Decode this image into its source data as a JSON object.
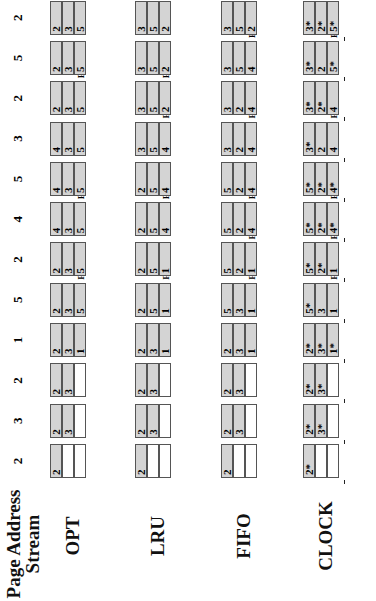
{
  "title": "Page Address Stream",
  "stream": [
    "2",
    "3",
    "2",
    "1",
    "5",
    "2",
    "4",
    "5",
    "3",
    "2",
    "5",
    "2"
  ],
  "rows": [
    {
      "label": "OPT",
      "steps": [
        {
          "frames": [
            "2",
            "",
            ""
          ],
          "fault": ""
        },
        {
          "frames": [
            "2",
            "3",
            ""
          ],
          "fault": ""
        },
        {
          "frames": [
            "2",
            "3",
            ""
          ],
          "fault": ""
        },
        {
          "frames": [
            "2",
            "3",
            "1"
          ],
          "fault": ""
        },
        {
          "frames": [
            "2",
            "3",
            "5"
          ],
          "fault": "F"
        },
        {
          "frames": [
            "2",
            "3",
            "5"
          ],
          "fault": ""
        },
        {
          "frames": [
            "4",
            "3",
            "5"
          ],
          "fault": "F"
        },
        {
          "frames": [
            "4",
            "3",
            "5"
          ],
          "fault": ""
        },
        {
          "frames": [
            "4",
            "3",
            "5"
          ],
          "fault": ""
        },
        {
          "frames": [
            "2",
            "3",
            "5"
          ],
          "fault": "F"
        },
        {
          "frames": [
            "2",
            "3",
            "5"
          ],
          "fault": ""
        },
        {
          "frames": [
            "2",
            "3",
            "5"
          ],
          "fault": ""
        }
      ]
    },
    {
      "label": "LRU",
      "steps": [
        {
          "frames": [
            "2",
            "",
            ""
          ],
          "fault": ""
        },
        {
          "frames": [
            "2",
            "3",
            ""
          ],
          "fault": ""
        },
        {
          "frames": [
            "2",
            "3",
            ""
          ],
          "fault": ""
        },
        {
          "frames": [
            "2",
            "3",
            "1"
          ],
          "fault": ""
        },
        {
          "frames": [
            "2",
            "5",
            "1"
          ],
          "fault": "F"
        },
        {
          "frames": [
            "2",
            "5",
            "1"
          ],
          "fault": ""
        },
        {
          "frames": [
            "2",
            "5",
            "4"
          ],
          "fault": "F"
        },
        {
          "frames": [
            "2",
            "5",
            "4"
          ],
          "fault": ""
        },
        {
          "frames": [
            "3",
            "5",
            "4"
          ],
          "fault": "F"
        },
        {
          "frames": [
            "3",
            "5",
            "2"
          ],
          "fault": "F"
        },
        {
          "frames": [
            "3",
            "5",
            "2"
          ],
          "fault": ""
        },
        {
          "frames": [
            "3",
            "5",
            "2"
          ],
          "fault": ""
        }
      ]
    },
    {
      "label": "FIFO",
      "steps": [
        {
          "frames": [
            "2",
            "",
            ""
          ],
          "fault": ""
        },
        {
          "frames": [
            "2",
            "3",
            ""
          ],
          "fault": ""
        },
        {
          "frames": [
            "2",
            "3",
            ""
          ],
          "fault": ""
        },
        {
          "frames": [
            "2",
            "3",
            "1"
          ],
          "fault": ""
        },
        {
          "frames": [
            "5",
            "3",
            "1"
          ],
          "fault": "F"
        },
        {
          "frames": [
            "5",
            "2",
            "1"
          ],
          "fault": "F"
        },
        {
          "frames": [
            "5",
            "2",
            "4"
          ],
          "fault": "F"
        },
        {
          "frames": [
            "5",
            "2",
            "4"
          ],
          "fault": ""
        },
        {
          "frames": [
            "3",
            "2",
            "4"
          ],
          "fault": "F"
        },
        {
          "frames": [
            "3",
            "2",
            "4"
          ],
          "fault": ""
        },
        {
          "frames": [
            "3",
            "5",
            "4"
          ],
          "fault": "F"
        },
        {
          "frames": [
            "3",
            "5",
            "2"
          ],
          "fault": "F"
        }
      ]
    },
    {
      "label": "CLOCK",
      "steps": [
        {
          "frames": [
            "2*",
            "",
            ""
          ],
          "fault": ""
        },
        {
          "frames": [
            "2*",
            "3*",
            ""
          ],
          "fault": ""
        },
        {
          "frames": [
            "2*",
            "3*",
            ""
          ],
          "fault": ""
        },
        {
          "frames": [
            "2*",
            "3*",
            "1*"
          ],
          "fault": ""
        },
        {
          "frames": [
            "5*",
            "3",
            "1"
          ],
          "fault": "F"
        },
        {
          "frames": [
            "5*",
            "2*",
            "1"
          ],
          "fault": "F"
        },
        {
          "frames": [
            "5*",
            "2*",
            "4*"
          ],
          "fault": "F"
        },
        {
          "frames": [
            "5*",
            "2*",
            "4*"
          ],
          "fault": ""
        },
        {
          "frames": [
            "3*",
            "2",
            "4"
          ],
          "fault": "F"
        },
        {
          "frames": [
            "3*",
            "2*",
            "4"
          ],
          "fault": ""
        },
        {
          "frames": [
            "3*",
            "2",
            "5*"
          ],
          "fault": "F"
        },
        {
          "frames": [
            "3*",
            "2*",
            "5*"
          ],
          "fault": ""
        }
      ]
    }
  ]
}
